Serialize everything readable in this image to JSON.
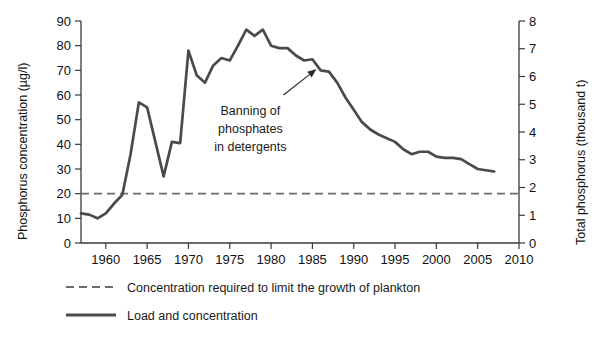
{
  "chart_data": {
    "type": "line",
    "title": "",
    "subtitle": "",
    "xlabel": "",
    "ylabel": "Phosphorus concentration (µg/l)",
    "y2label": "Total phosphorus (thousand t)",
    "xlim": [
      1957,
      2010
    ],
    "ylim": [
      0,
      90
    ],
    "y2lim": [
      0,
      8
    ],
    "grid": false,
    "legend_position": "bottom-left",
    "xticks": [
      1960,
      1965,
      1970,
      1975,
      1980,
      1985,
      1990,
      1995,
      2000,
      2005,
      2010
    ],
    "xtick_labels": [
      "1960",
      "1965",
      "1970",
      "1975",
      "1980",
      "1985",
      "1990",
      "1995",
      "2000",
      "2005",
      "2010"
    ],
    "yticks": [
      0,
      10,
      20,
      30,
      40,
      50,
      60,
      70,
      80,
      90
    ],
    "ytick_labels": [
      "0",
      "10",
      "20",
      "30",
      "40",
      "50",
      "60",
      "70",
      "80",
      "90"
    ],
    "y2ticks": [
      0,
      1,
      2,
      3,
      4,
      5,
      6,
      7,
      8
    ],
    "y2tick_labels": [
      "0",
      "1",
      "2",
      "3",
      "4",
      "5",
      "6",
      "7",
      "8"
    ],
    "x": [
      1957,
      1958,
      1959,
      1960,
      1961,
      1962,
      1963,
      1964,
      1965,
      1966,
      1967,
      1968,
      1969,
      1970,
      1971,
      1972,
      1973,
      1974,
      1975,
      1976,
      1977,
      1978,
      1979,
      1980,
      1981,
      1982,
      1983,
      1984,
      1985,
      1986,
      1987,
      1988,
      1989,
      1990,
      1991,
      1992,
      1993,
      1994,
      1995,
      1996,
      1997,
      1998,
      1999,
      2000,
      2001,
      2002,
      2003,
      2004,
      2005,
      2006,
      2007
    ],
    "series": [
      {
        "name": "Load and concentration",
        "color": "#4a4a4a",
        "style": "solid",
        "values": [
          12,
          11.5,
          10,
          12,
          16,
          19.5,
          36,
          57,
          55,
          41,
          27,
          41,
          40.5,
          78,
          68,
          65,
          72,
          75,
          74,
          80,
          86.5,
          84,
          86.5,
          80,
          79,
          79,
          76,
          74,
          74.5,
          70,
          69.5,
          65,
          59,
          54,
          49,
          46,
          44,
          42.5,
          41,
          38,
          36,
          37,
          37,
          35,
          34.5,
          34.5,
          34,
          32,
          30,
          29.5,
          29
        ]
      },
      {
        "name": "Concentration required to limit the growth of plankton",
        "color": "#6b6b6b",
        "style": "dashed",
        "constant_value": 20
      }
    ],
    "annotations": [
      {
        "text_lines": [
          "Banning of",
          "phosphates",
          "in detergents"
        ],
        "text_x": 1977.5,
        "text_y": 52,
        "arrow_from_x": 1981.5,
        "arrow_from_y": 60,
        "arrow_to_x": 1985.5,
        "arrow_to_y": 70.5
      }
    ],
    "legend": [
      {
        "label": "Concentration required to limit the growth of plankton",
        "style": "dashed",
        "color": "#6b6b6b"
      },
      {
        "label": "Load and concentration",
        "style": "solid",
        "color": "#4a4a4a"
      }
    ],
    "colors": {
      "series_line": "#4a4a4a",
      "threshold_line": "#6b6b6b",
      "axis": "#3a3a3a",
      "text": "#1a1a1a",
      "background": "#ffffff"
    }
  }
}
